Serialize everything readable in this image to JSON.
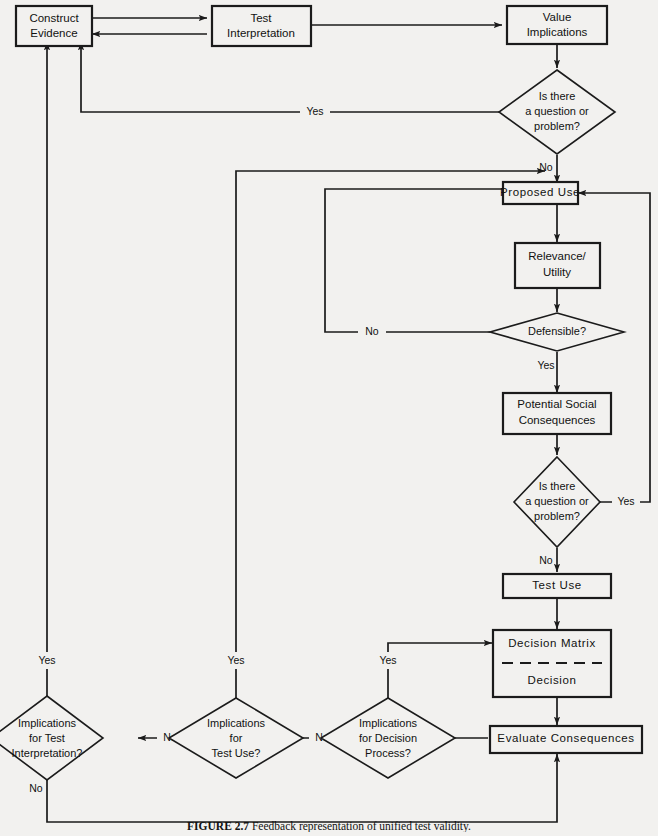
{
  "figure": {
    "caption_label": "FIGURE 2.7",
    "caption_text": "Feedback representation of unified test validity."
  },
  "nodes": {
    "construct_evidence": {
      "line1": "Construct",
      "line2": "Evidence"
    },
    "test_interpretation": {
      "line1": "Test",
      "line2": "Interpretation"
    },
    "value_implications": {
      "line1": "Value",
      "line2": "Implications"
    },
    "question1": {
      "line1": "Is there",
      "line2": "a question or",
      "line3": "problem?"
    },
    "proposed_use": {
      "line1": "Proposed Use"
    },
    "relevance_utility": {
      "line1": "Relevance/",
      "line2": "Utility"
    },
    "defensible": {
      "line1": "Defensible?"
    },
    "potential_social": {
      "line1": "Potential Social",
      "line2": "Consequences"
    },
    "question2": {
      "line1": "Is there",
      "line2": "a question or",
      "line3": "problem?"
    },
    "test_use": {
      "line1": "Test Use"
    },
    "decision_matrix": {
      "line1": "Decision Matrix",
      "line2": "Decision"
    },
    "evaluate_consequences": {
      "line1": "Evaluate Consequences"
    },
    "impl_test_interp": {
      "line1": "Implications",
      "line2": "for Test",
      "line3": "Interpretation?"
    },
    "impl_test_use": {
      "line1": "Implications",
      "line2": "for",
      "line3": "Test Use?"
    },
    "impl_decision_process": {
      "line1": "Implications",
      "line2": "for Decision",
      "line3": "Process?"
    }
  },
  "edge_labels": {
    "q1_yes": "Yes",
    "q1_no": "No",
    "defensible_no": "No",
    "defensible_yes": "Yes",
    "q2_yes": "Yes",
    "q2_no": "No",
    "iti_yes": "Yes",
    "iti_no": "No",
    "itu_yes": "Yes",
    "itu_no": "No",
    "idp_yes": "Yes",
    "idp_no": "No"
  },
  "colors": {
    "background": "#f2f1ef",
    "stroke": "#1b1b1b",
    "text": "#111111"
  }
}
